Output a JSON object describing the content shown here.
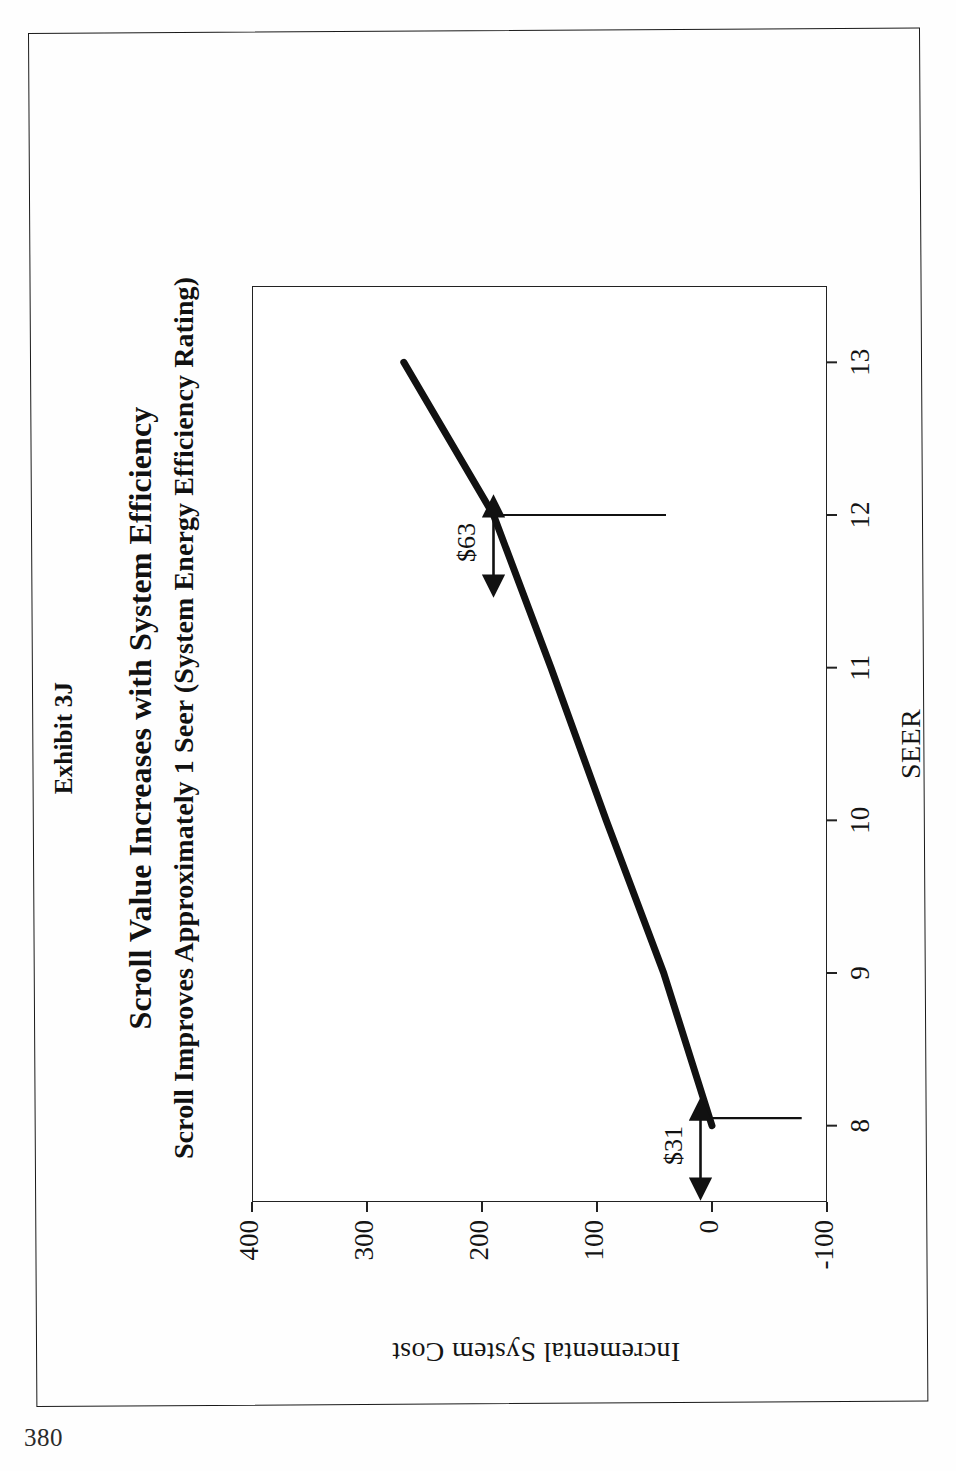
{
  "page": {
    "number": "380"
  },
  "figure": {
    "exhibit_label": "Exhibit 3J",
    "title_main": "Scroll Value Increases with System Efficiency",
    "title_sub": "Scroll Improves Approximately 1 Seer (System Energy Efficiency Rating)"
  },
  "chart_data": {
    "type": "line",
    "title": "Scroll Value Increases with System Efficiency",
    "subtitle": "Scroll Improves Approximately 1 Seer (System Energy Efficiency Rating)",
    "xlabel": "SEER",
    "ylabel": "Incremental System Cost",
    "xlim": [
      7.5,
      13.5
    ],
    "ylim": [
      -100,
      400
    ],
    "xticks": [
      "8",
      "9",
      "10",
      "11",
      "12",
      "13"
    ],
    "yticks": [
      "400",
      "300",
      "200",
      "100",
      "0",
      "-100"
    ],
    "grid": false,
    "legend": "none",
    "series": [
      {
        "name": "Incremental System Cost",
        "x": [
          8,
          9,
          10,
          11,
          12,
          13
        ],
        "y": [
          0,
          42,
          92,
          140,
          190,
          268
        ]
      }
    ],
    "annotations": [
      {
        "label": "$31",
        "at_seer": 8,
        "span_cost": 31
      },
      {
        "label": "$63",
        "at_seer": 12,
        "span_cost": 63
      }
    ]
  },
  "axis": {
    "x_title": "SEER",
    "y_title": "Incremental System Cost",
    "x_ticks": [
      "8",
      "9",
      "10",
      "11",
      "12",
      "13"
    ],
    "y_ticks": [
      "400",
      "300",
      "200",
      "100",
      "0",
      "-100"
    ]
  },
  "annotations": {
    "upper": "$63",
    "lower": "$31"
  }
}
